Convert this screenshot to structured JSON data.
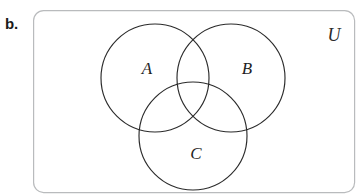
{
  "figure": {
    "part_label": "b.",
    "type": "venn-diagram",
    "set_count": 3,
    "universe": {
      "label": "U",
      "label_x": 334,
      "label_y": 37,
      "rect": {
        "x": 33,
        "y": 10,
        "width": 322,
        "height": 183,
        "radius": 10
      },
      "border_color": "#b9bbbd",
      "fill_color": "#ffffff"
    },
    "circles": [
      {
        "id": "set-a",
        "label": "A",
        "cx": 155,
        "cy": 78,
        "r": 54,
        "label_x": 147,
        "label_y": 70
      },
      {
        "id": "set-b",
        "label": "B",
        "cx": 231,
        "cy": 78,
        "r": 54,
        "label_x": 247,
        "label_y": 70
      },
      {
        "id": "set-c",
        "label": "C",
        "cx": 193,
        "cy": 136,
        "r": 54,
        "label_x": 196,
        "label_y": 155
      }
    ],
    "stroke_color": "#2b2b2b",
    "text_color": "#1f1f1f"
  }
}
